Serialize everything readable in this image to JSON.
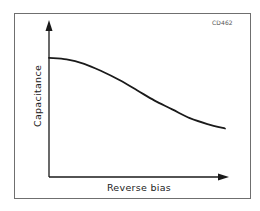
{
  "figure": {
    "code": "CD462",
    "frame_color": "#6f6f6f",
    "line_color": "#1a1a1a"
  },
  "chart_data": {
    "type": "line",
    "title": "",
    "xlabel": "Reverse bias",
    "ylabel": "Capacitance",
    "grid": false,
    "legend": null,
    "axis_ticks": "none (qualitative axes with arrowheads)",
    "xlim": [
      0,
      1
    ],
    "ylim": [
      0,
      1
    ],
    "series": [
      {
        "name": "Capacitance vs reverse bias",
        "x": [
          0.0,
          0.1,
          0.2,
          0.3,
          0.4,
          0.5,
          0.6,
          0.7,
          0.8,
          0.9,
          1.0
        ],
        "values": [
          0.81,
          0.8,
          0.77,
          0.72,
          0.66,
          0.59,
          0.52,
          0.46,
          0.4,
          0.36,
          0.33
        ]
      }
    ],
    "annotations": [
      "CD462"
    ]
  }
}
